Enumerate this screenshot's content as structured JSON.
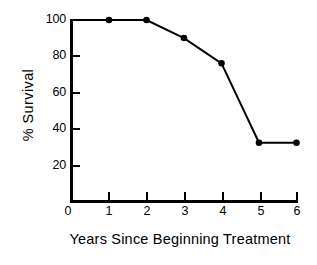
{
  "chart_data": {
    "type": "line",
    "title": "",
    "xlabel": "Years Since Beginning Treatment",
    "ylabel": "%  Survival",
    "x": [
      0,
      1,
      2,
      3,
      4,
      5,
      6
    ],
    "values": [
      100,
      100,
      100,
      90,
      76,
      32,
      32
    ],
    "markers": [
      false,
      true,
      true,
      true,
      true,
      true,
      true
    ],
    "xlim": [
      0,
      6
    ],
    "ylim": [
      0,
      100
    ],
    "xticks": [
      0,
      1,
      2,
      3,
      4,
      5,
      6
    ],
    "xtick_labels": [
      "0",
      "1",
      "2",
      "3",
      "4",
      "5",
      "6"
    ],
    "yticks": [
      20,
      40,
      60,
      80,
      100
    ],
    "ytick_labels": [
      "20",
      "40",
      "60",
      "80",
      "100"
    ],
    "grid": false,
    "legend": null,
    "series": [
      {
        "name": "Survival",
        "color": "#000000",
        "marker": "filled-circle",
        "points": [
          {
            "x": 0,
            "y": 100
          },
          {
            "x": 1,
            "y": 100
          },
          {
            "x": 2,
            "y": 100
          },
          {
            "x": 3,
            "y": 90
          },
          {
            "x": 4,
            "y": 76
          },
          {
            "x": 5,
            "y": 32
          },
          {
            "x": 6,
            "y": 32
          }
        ]
      }
    ]
  },
  "colors": {
    "background": "#ffffff",
    "axis": "#000000",
    "line": "#000000",
    "marker": "#000000",
    "text": "#000000"
  }
}
